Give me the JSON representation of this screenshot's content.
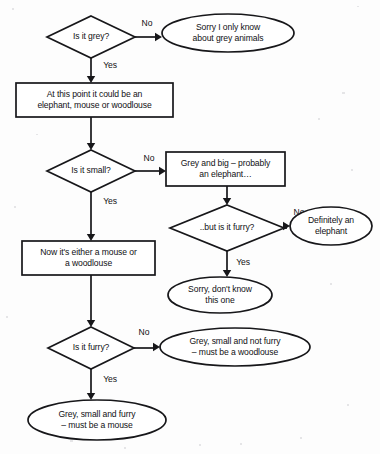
{
  "diagram": {
    "background_color": "#fdfdfd",
    "stroke_color": "#17171a",
    "text_color": "#111114",
    "nodes": [
      {
        "id": "q-grey",
        "shape": "diamond",
        "name": "decision-is-it-grey",
        "lines": [
          "Is it grey?"
        ],
        "cx": 91,
        "cy": 37,
        "rx": 44,
        "ry": 21
      },
      {
        "id": "t-not-grey",
        "shape": "ellipse",
        "name": "terminator-only-grey-animals",
        "lines": [
          "Sorry I only know",
          "about grey animals"
        ],
        "cx": 228,
        "cy": 33,
        "rx": 66,
        "ry": 19
      },
      {
        "id": "p-could-be",
        "shape": "rect",
        "name": "process-could-be-three-animals",
        "lines": [
          "At this point it could be an",
          "elephant, mouse or woodlouse"
        ],
        "x": 16,
        "y": 83,
        "w": 157,
        "h": 34
      },
      {
        "id": "q-small",
        "shape": "diamond",
        "name": "decision-is-it-small",
        "lines": [
          "Is it small?"
        ],
        "cx": 91,
        "cy": 171,
        "rx": 44,
        "ry": 21
      },
      {
        "id": "p-grey-big",
        "shape": "rect",
        "name": "process-grey-and-big",
        "lines": [
          "Grey and big – probably",
          "an elephant…"
        ],
        "x": 166,
        "y": 152,
        "w": 119,
        "h": 34
      },
      {
        "id": "q-big-furry",
        "shape": "diamond",
        "name": "decision-but-is-it-furry",
        "lines": [
          "..but is it furry?"
        ],
        "cx": 227,
        "cy": 228,
        "rx": 57,
        "ry": 23
      },
      {
        "id": "t-elephant",
        "shape": "ellipse",
        "name": "terminator-definitely-an-elephant",
        "lines": [
          "Definitely an",
          "elephant"
        ],
        "cx": 331,
        "cy": 226,
        "rx": 41,
        "ry": 19
      },
      {
        "id": "p-mouse-or-woodlouse",
        "shape": "rect",
        "name": "process-mouse-or-woodlouse",
        "lines": [
          "Now it's either a mouse or",
          "a woodlouse"
        ],
        "x": 22,
        "y": 241,
        "w": 133,
        "h": 34
      },
      {
        "id": "t-dont-know",
        "shape": "ellipse",
        "name": "terminator-dont-know-this-one",
        "lines": [
          "Sorry, don't know",
          "this one"
        ],
        "cx": 220,
        "cy": 295,
        "rx": 52,
        "ry": 18
      },
      {
        "id": "q-furry",
        "shape": "diamond",
        "name": "decision-is-it-furry",
        "lines": [
          "Is it furry?"
        ],
        "cx": 91,
        "cy": 348,
        "rx": 43,
        "ry": 21
      },
      {
        "id": "t-woodlouse",
        "shape": "ellipse",
        "name": "terminator-must-be-a-woodlouse",
        "lines": [
          "Grey, small and not furry",
          "– must be a woodlouse"
        ],
        "cx": 235,
        "cy": 347,
        "rx": 75,
        "ry": 19
      },
      {
        "id": "t-mouse",
        "shape": "ellipse",
        "name": "terminator-must-be-a-mouse",
        "lines": [
          "Grey, small and furry",
          "– must be a mouse"
        ],
        "cx": 97,
        "cy": 420,
        "rx": 69,
        "ry": 20
      }
    ],
    "edges": [
      {
        "id": "e-grey-no",
        "name": "edge-grey-no",
        "label": "No",
        "label_x": 147,
        "label_y": 24,
        "path": "M 135 37 L 159 37",
        "arrow": "right",
        "ax": 162,
        "ay": 37
      },
      {
        "id": "e-grey-yes",
        "name": "edge-grey-yes",
        "label": "Yes",
        "label_x": 110,
        "label_y": 66,
        "path": "M 91 58 L 91 79",
        "arrow": "down",
        "ax": 91,
        "ay": 83
      },
      {
        "id": "e-couldbe-small",
        "name": "edge-couldbe-to-small",
        "label": "",
        "label_x": 0,
        "label_y": 0,
        "path": "M 91 117 L 91 146",
        "arrow": "down",
        "ax": 91,
        "ay": 150
      },
      {
        "id": "e-small-no",
        "name": "edge-small-no",
        "label": "No",
        "label_x": 149,
        "label_y": 159,
        "path": "M 135 171 L 162 171",
        "arrow": "right",
        "ax": 166,
        "ay": 171
      },
      {
        "id": "e-small-yes",
        "name": "edge-small-yes",
        "label": "Yes",
        "label_x": 110,
        "label_y": 202,
        "path": "M 91 192 L 91 237",
        "arrow": "down",
        "ax": 91,
        "ay": 241
      },
      {
        "id": "e-greybig-furry",
        "name": "edge-greybig-to-furry",
        "label": "",
        "label_x": 0,
        "label_y": 0,
        "path": "M 227 186 L 227 201",
        "arrow": "down",
        "ax": 227,
        "ay": 205
      },
      {
        "id": "e-bigfurry-no",
        "name": "edge-bigfurry-no",
        "label": "No",
        "label_x": 299,
        "label_y": 213,
        "path": "M 284 228 L 287 228",
        "arrow": "right",
        "ax": 290,
        "ay": 226
      },
      {
        "id": "e-bigfurry-yes",
        "name": "edge-bigfurry-yes",
        "label": "Yes",
        "label_x": 243,
        "label_y": 263,
        "path": "M 227 251 L 227 273",
        "arrow": "down",
        "ax": 227,
        "ay": 277
      },
      {
        "id": "e-mousewood-furry",
        "name": "edge-mousewood-to-furry",
        "label": "",
        "label_x": 0,
        "label_y": 0,
        "path": "M 91 275 L 91 323",
        "arrow": "down",
        "ax": 91,
        "ay": 327
      },
      {
        "id": "e-furry-no",
        "name": "edge-furry-no",
        "label": "No",
        "label_x": 144,
        "label_y": 333,
        "path": "M 134 348 L 156 348",
        "arrow": "right",
        "ax": 160,
        "ay": 347
      },
      {
        "id": "e-furry-yes",
        "name": "edge-furry-yes",
        "label": "Yes",
        "label_x": 110,
        "label_y": 380,
        "path": "M 91 369 L 91 396",
        "arrow": "down",
        "ax": 91,
        "ay": 400
      }
    ]
  }
}
